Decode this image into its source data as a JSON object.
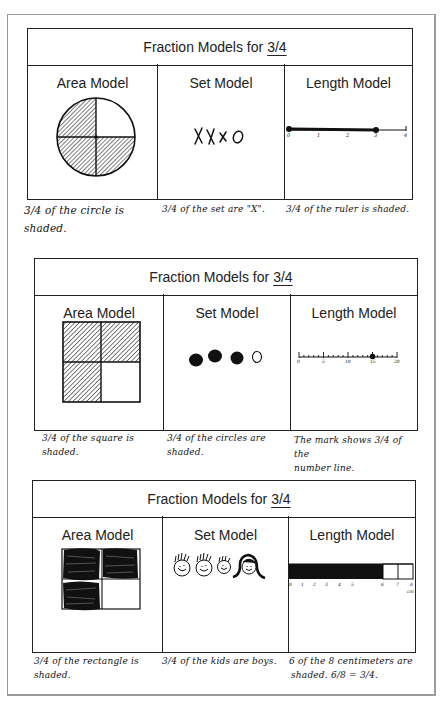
{
  "page": {
    "title_prefix": "Fraction Models for",
    "fraction": "3/4"
  },
  "tables": [
    {
      "title_prefix": "Fraction Models for",
      "fraction": "3/4",
      "columns": [
        {
          "heading": "Area Model",
          "figure": "circle divided into 4 quarters; 3 quarters hatched (top-left, bottom-left, bottom-right)",
          "shaded_parts": 3,
          "total_parts": 4,
          "caption_line1": "3/4 of the circle is",
          "caption_line2": "shaded."
        },
        {
          "heading": "Set Model",
          "figure": "set of 4 symbols",
          "symbols": [
            "X",
            "X",
            "x",
            "O"
          ],
          "caption_line1": "3/4 of the set are \"X\".",
          "caption_line2": ""
        },
        {
          "heading": "Length Model",
          "figure": "number line 0 to 4, bold segment from 0 to 3",
          "tick_labels": [
            "0",
            "1",
            "2",
            "3",
            "4"
          ],
          "segment_start": 0,
          "segment_end": 3,
          "caption_line1": "3/4 of the ruler is shaded.",
          "caption_line2": ""
        }
      ]
    },
    {
      "title_prefix": "Fraction Models for",
      "fraction": "3/4",
      "columns": [
        {
          "heading": "Area Model",
          "figure": "square divided into 4 quarters; 3 hatched, bottom-right blank",
          "shaded_parts": 3,
          "total_parts": 4,
          "caption_line1": "3/4 of the square is shaded.",
          "caption_line2": ""
        },
        {
          "heading": "Set Model",
          "figure": "3 filled circles and 1 empty circle",
          "filled": 3,
          "total": 4,
          "caption_line1": "3/4 of the circles are",
          "caption_line2": "shaded."
        },
        {
          "heading": "Length Model",
          "figure": "number line 0 to 20 with a mark at 15",
          "tick_labels": [
            "0",
            "5",
            "10",
            "15",
            "20"
          ],
          "mark_at": 15,
          "caption_line1": "The mark shows 3/4 of the",
          "caption_line2": "number line."
        }
      ]
    },
    {
      "title_prefix": "Fraction Models for",
      "fraction": "3/4",
      "columns": [
        {
          "heading": "Area Model",
          "figure": "rectangle divided into 4 quarters; 3 scribbled black, bottom-right blank",
          "shaded_parts": 3,
          "total_parts": 4,
          "caption_line1": "3/4 of the rectangle is shaded.",
          "caption_line2": ""
        },
        {
          "heading": "Set Model",
          "figure": "4 kids' faces: 3 boys, 1 girl with long hair",
          "boys": 3,
          "total": 4,
          "caption_line1": "3/4 of the kids are boys.",
          "caption_line2": ""
        },
        {
          "heading": "Length Model",
          "figure": "8 cm bar, first 6 cm filled black",
          "tick_labels": [
            "0",
            "1",
            "2",
            "3",
            "4",
            "5",
            "6",
            "7",
            "8"
          ],
          "unit": "cm",
          "filled_cm": 6,
          "total_cm": 8,
          "caption_line1": "6 of the 8 centimeters are",
          "caption_line2": "shaded. 6/8 = 3/4."
        }
      ]
    }
  ]
}
